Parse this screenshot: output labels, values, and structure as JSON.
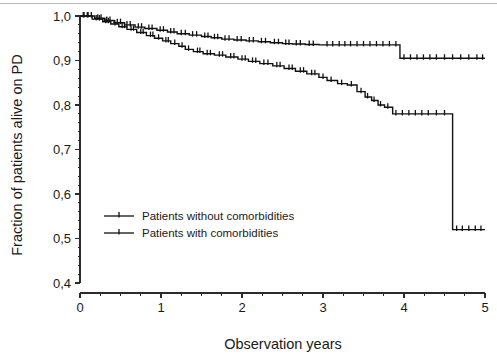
{
  "figure": {
    "name": "kaplan-meier-survival-plot",
    "background": "#ffffff",
    "ink_color": "#111111",
    "scan_artifact_color": "#b9b9b9"
  },
  "chart_data": {
    "type": "line",
    "title": "",
    "subtitle": "",
    "xlabel": "Observation years",
    "ylabel": "Fraction of patients alive on PD",
    "xlim": [
      0,
      5
    ],
    "ylim": [
      0.4,
      1.0
    ],
    "grid": false,
    "legend_position": "inside-lower-left",
    "x_ticks": [
      0,
      1,
      2,
      3,
      4,
      5
    ],
    "x_tick_labels": [
      "0",
      "1",
      "2",
      "3",
      "4",
      "5"
    ],
    "x_minor_tick_step": 0.25,
    "y_ticks": [
      0.4,
      0.5,
      0.6,
      0.7,
      0.8,
      0.9,
      1.0
    ],
    "y_tick_labels": [
      "0,4",
      "0,5",
      "0,6",
      "0,7",
      "0,8",
      "0,9",
      "1,0"
    ],
    "y_minor_tick_step": 0.02,
    "decimal_separator": "comma",
    "series": [
      {
        "name": "Patients without comorbidities",
        "style": "step-post",
        "color": "#111111",
        "x": [
          0,
          0.18,
          0.3,
          0.42,
          0.55,
          0.68,
          0.8,
          0.95,
          1.08,
          1.2,
          1.35,
          1.5,
          1.62,
          1.75,
          1.9,
          2.05,
          2.2,
          2.35,
          2.5,
          2.62,
          2.78,
          2.95,
          3.95,
          5.0
        ],
        "y": [
          1.0,
          0.995,
          0.99,
          0.985,
          0.98,
          0.975,
          0.972,
          0.968,
          0.964,
          0.96,
          0.957,
          0.954,
          0.951,
          0.948,
          0.946,
          0.944,
          0.942,
          0.94,
          0.938,
          0.937,
          0.936,
          0.935,
          0.905,
          0.905
        ],
        "censor_x": [
          0.05,
          0.1,
          0.14,
          0.22,
          0.26,
          0.33,
          0.37,
          0.46,
          0.5,
          0.58,
          0.62,
          0.72,
          0.76,
          0.85,
          0.89,
          0.99,
          1.03,
          1.12,
          1.16,
          1.25,
          1.3,
          1.39,
          1.44,
          1.54,
          1.58,
          1.66,
          1.7,
          1.79,
          1.84,
          1.94,
          1.99,
          2.09,
          2.14,
          2.24,
          2.29,
          2.4,
          2.45,
          2.54,
          2.58,
          2.67,
          2.72,
          2.83,
          2.88,
          3.05,
          3.12,
          3.2,
          3.27,
          3.34,
          3.42,
          3.5,
          3.58,
          3.66,
          3.74,
          3.82,
          3.9,
          4.0,
          4.08,
          4.16,
          4.24,
          4.32,
          4.4,
          4.5,
          4.6,
          4.7,
          4.8,
          4.9,
          4.97
        ]
      },
      {
        "name": "Patients with comorbidities",
        "style": "step-post",
        "color": "#111111",
        "x": [
          0,
          0.15,
          0.28,
          0.38,
          0.48,
          0.58,
          0.7,
          0.82,
          0.92,
          1.02,
          1.12,
          1.22,
          1.3,
          1.4,
          1.52,
          1.66,
          1.8,
          1.95,
          2.08,
          2.22,
          2.38,
          2.52,
          2.66,
          2.8,
          2.95,
          3.05,
          3.18,
          3.3,
          3.42,
          3.52,
          3.6,
          3.68,
          3.76,
          3.86,
          4.6,
          5.0
        ],
        "y": [
          1.0,
          0.993,
          0.987,
          0.982,
          0.976,
          0.97,
          0.963,
          0.956,
          0.95,
          0.944,
          0.938,
          0.932,
          0.925,
          0.92,
          0.915,
          0.912,
          0.908,
          0.903,
          0.898,
          0.893,
          0.888,
          0.882,
          0.876,
          0.87,
          0.862,
          0.855,
          0.848,
          0.845,
          0.83,
          0.818,
          0.81,
          0.8,
          0.795,
          0.78,
          0.52,
          0.52
        ],
        "censor_x": [
          0.04,
          0.09,
          0.2,
          0.24,
          0.32,
          0.35,
          0.43,
          0.52,
          0.55,
          0.63,
          0.66,
          0.75,
          0.78,
          0.87,
          0.9,
          0.97,
          1.06,
          1.09,
          1.17,
          1.26,
          1.34,
          1.45,
          1.48,
          1.57,
          1.61,
          1.72,
          1.76,
          1.86,
          1.9,
          2.0,
          2.04,
          2.13,
          2.17,
          2.27,
          2.32,
          2.43,
          2.47,
          2.58,
          2.62,
          2.72,
          2.76,
          2.86,
          2.9,
          3.0,
          3.1,
          3.23,
          3.35,
          3.47,
          3.55,
          3.63,
          3.71,
          3.8,
          3.9,
          3.98,
          4.06,
          4.14,
          4.22,
          4.3,
          4.4,
          4.5,
          4.65,
          4.72,
          4.8,
          4.88,
          4.95
        ]
      }
    ]
  },
  "legend": {
    "entries": [
      {
        "label": "Patients without comorbidities"
      },
      {
        "label": "Patients with comorbidities"
      }
    ]
  }
}
